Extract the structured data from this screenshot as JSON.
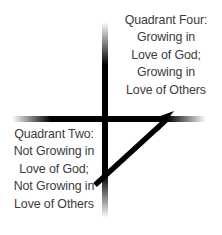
{
  "diagram": {
    "background_color": "#ffffff",
    "text_color": "#3b3b3b",
    "axis_color": "#000000",
    "arrow_color": "#000000",
    "axes": {
      "name": "cross-axes",
      "center_x": 105,
      "center_y": 119,
      "vertical_top": 22,
      "vertical_bottom": 218,
      "horizontal_left": 12,
      "horizontal_right": 206,
      "stroke_width": 6,
      "fade_ends": true
    },
    "arrow": {
      "name": "growth-arrow",
      "from_x": 95,
      "from_y": 185,
      "to_x": 174,
      "to_y": 112,
      "stroke_width": 5,
      "head_size": 14,
      "direction": "lower-left to upper-right"
    }
  },
  "quadrant_four": {
    "label": "Quadrant Four:",
    "lines": [
      "Quadrant Four:",
      "Growing in",
      "Love of God;",
      "Growing in",
      "Love of Others"
    ],
    "position": "top-right"
  },
  "quadrant_two": {
    "label": "Quadrant Two:",
    "lines": [
      "Quadrant Two:",
      "Not Growing in",
      "Love of God;",
      "Not Growing in",
      "Love of Others"
    ],
    "position": "bottom-left"
  }
}
